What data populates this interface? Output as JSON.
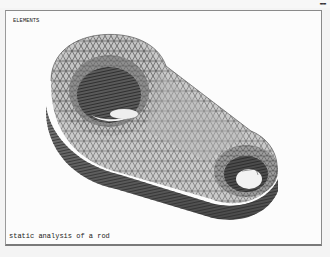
{
  "window": {
    "corner_label": "▬▬"
  },
  "graphics": {
    "plot_label": "ELEMENTS",
    "title": "static analysis of a rod",
    "model": {
      "type": "connecting-rod-fe-mesh",
      "mesh": "triangular-shell-mesh",
      "colors": {
        "face_light": "#cfcfcf",
        "face_mid": "#a9a9a9",
        "face_dark": "#6c6c6c",
        "edge_lines": "#3a3a3a",
        "background": "#fcfcfc"
      }
    }
  }
}
